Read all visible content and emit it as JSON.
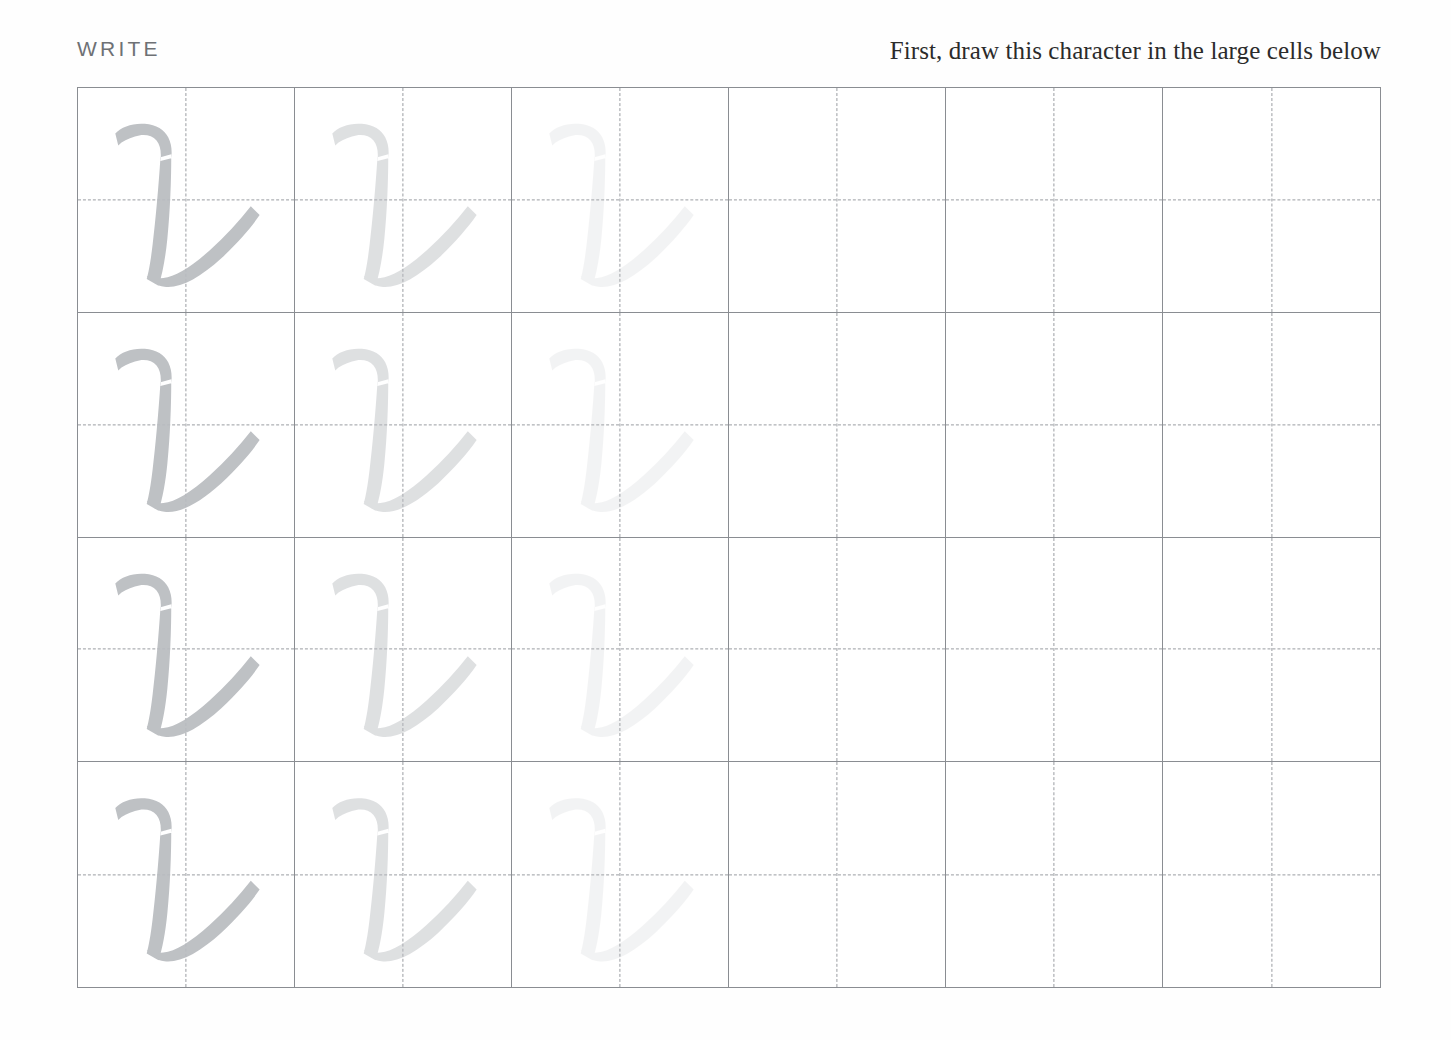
{
  "page": {
    "background_color": "#fefefe",
    "grid_line_color": "#8a8d92",
    "guide_line_color": "#9a9da2",
    "stroke_color": "#b9bcc0"
  },
  "header": {
    "section_label": "WRITE",
    "instruction": "First, draw this character in the large cells below"
  },
  "practice_grid": {
    "columns": 6,
    "rows": 4,
    "character": "レ",
    "character_name": "katakana-re",
    "fade_levels": [
      1,
      2,
      3,
      0,
      0,
      0
    ],
    "cells": [
      [
        {
          "glyph": "レ",
          "fade": 1
        },
        {
          "glyph": "レ",
          "fade": 2
        },
        {
          "glyph": "レ",
          "fade": 3
        },
        {
          "glyph": "",
          "fade": 0
        },
        {
          "glyph": "",
          "fade": 0
        },
        {
          "glyph": "",
          "fade": 0
        }
      ],
      [
        {
          "glyph": "レ",
          "fade": 1
        },
        {
          "glyph": "レ",
          "fade": 2
        },
        {
          "glyph": "レ",
          "fade": 3
        },
        {
          "glyph": "",
          "fade": 0
        },
        {
          "glyph": "",
          "fade": 0
        },
        {
          "glyph": "",
          "fade": 0
        }
      ],
      [
        {
          "glyph": "レ",
          "fade": 1
        },
        {
          "glyph": "レ",
          "fade": 2
        },
        {
          "glyph": "レ",
          "fade": 3
        },
        {
          "glyph": "",
          "fade": 0
        },
        {
          "glyph": "",
          "fade": 0
        },
        {
          "glyph": "",
          "fade": 0
        }
      ],
      [
        {
          "glyph": "レ",
          "fade": 1
        },
        {
          "glyph": "レ",
          "fade": 2
        },
        {
          "glyph": "レ",
          "fade": 3
        },
        {
          "glyph": "",
          "fade": 0
        },
        {
          "glyph": "",
          "fade": 0
        },
        {
          "glyph": "",
          "fade": 0
        }
      ]
    ]
  }
}
